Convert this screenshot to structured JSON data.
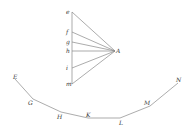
{
  "diagram": {
    "fan": {
      "apex": {
        "label": "A",
        "x": 115,
        "y": 51
      },
      "points": [
        {
          "label": "e",
          "x": 72,
          "y": 12
        },
        {
          "label": "f",
          "x": 72,
          "y": 32
        },
        {
          "label": "g",
          "x": 72,
          "y": 42
        },
        {
          "label": "h",
          "x": 72,
          "y": 51
        },
        {
          "label": "i",
          "x": 72,
          "y": 68
        },
        {
          "label": "m",
          "x": 72,
          "y": 84
        }
      ]
    },
    "curve": {
      "points": [
        {
          "label": "E",
          "x": 15,
          "y": 79
        },
        {
          "label": "G",
          "x": 33,
          "y": 99
        },
        {
          "label": "H",
          "x": 61,
          "y": 112
        },
        {
          "label": "K",
          "x": 88,
          "y": 118
        },
        {
          "label": "L",
          "x": 120,
          "y": 118
        },
        {
          "label": "M",
          "x": 150,
          "y": 106
        },
        {
          "label": "N",
          "x": 178,
          "y": 83
        }
      ]
    },
    "line_color": "#888888"
  }
}
